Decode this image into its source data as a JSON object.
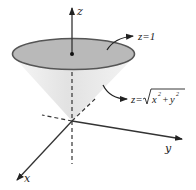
{
  "figure": {
    "axes": {
      "x_label": "x",
      "y_label": "y",
      "z_label": "z"
    },
    "annotations": [
      {
        "id": "plane",
        "text": "z=1"
      },
      {
        "id": "cone",
        "text_prefix": "z=",
        "radicand": "x² + y²",
        "x_term": "x",
        "x_exp": "2",
        "plus": "+",
        "y_term": "y",
        "y_exp": "2"
      }
    ],
    "colors": {
      "disk_fill": "#b9b9b9",
      "disk_stroke": "#555555",
      "cone_fill": "#ececec",
      "axis": "#333333"
    }
  }
}
